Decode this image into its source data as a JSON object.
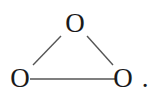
{
  "molecule": {
    "atoms": [
      {
        "id": "top",
        "label": "O"
      },
      {
        "id": "bottom-left",
        "label": "O"
      },
      {
        "id": "bottom-right",
        "label": "O"
      }
    ],
    "bonds": [
      {
        "from": "top",
        "to": "bottom-left",
        "order": 1
      },
      {
        "from": "top",
        "to": "bottom-right",
        "order": 1
      },
      {
        "from": "bottom-left",
        "to": "bottom-right",
        "order": 1
      }
    ],
    "trailing_punctuation": ".",
    "bond_color": "#555555",
    "text_color": "#1a1a1a"
  }
}
